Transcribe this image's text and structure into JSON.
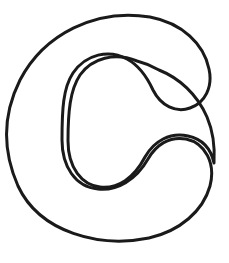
{
  "document": {
    "kind": "letter-outline-drawing",
    "title": "Letter C Outline",
    "character": "C",
    "style": "coloring-page-stencil",
    "canvas": {
      "width": 229,
      "height": 263,
      "background_color": "#ffffff"
    }
  },
  "artwork": {
    "name": "uppercase-letter-c",
    "character": "C",
    "stroke_color": "#1a1a1a",
    "fill_color": "#ffffff",
    "stroke_width": 3,
    "outer_bounds": {
      "left": 9,
      "top": 13,
      "right": 212,
      "bottom": 237
    },
    "inner_bounds": {
      "left": 67,
      "top": 60,
      "right": 175,
      "bottom": 190
    },
    "terminals": {
      "upper_hook_tip_y": 110,
      "lower_hook_top_y": 140,
      "gap_between_terminals": 30
    },
    "outer_path": "M 150 17 C 96 8 44 34 20 80 C 2 116 3 152 18 186 C 40 233 100 248 149 238 C 180 231 203 211 210 186 C 216 163 205 143 186 139 C 169 136 156 145 148 159 C 136 180 117 191 98 189 C 75 187 62 166 62 140 C 62 110 63 88 73 73 C 86 54 109 49 127 59 C 140 66 147 77 153 90 C 161 106 176 113 190 108 C 205 103 213 87 209 69 C 204 44 182 23 150 17 Z",
    "inner_path": "M 137 61 C 115 52 92 58 80 75 C 70 90 68 112 68 141 C 68 168 82 185 100 187 C 118 189 134 178 145 157 C 154 141 170 132 188 136 C 202 139 211 149 214 163 C 215 147 213 131 207 117 C 197 94 179 78 159 70 C 152 66 145 63 137 61 Z"
  }
}
